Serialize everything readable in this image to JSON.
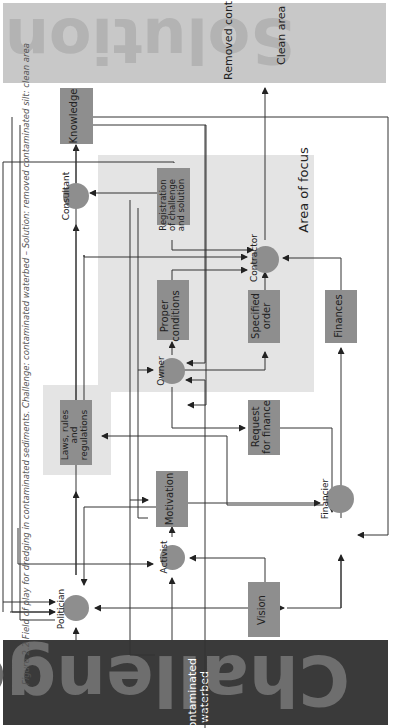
{
  "solution": {
    "title": "Solution",
    "items": [
      "Removed contaminated silt",
      "Clean area"
    ],
    "color": "#c8c8c8",
    "text_color": "#b3b3b3"
  },
  "challenge": {
    "title": "Challenge",
    "items": [
      "Contaminated waterbed"
    ],
    "color": "#3a3a3a",
    "text_color": "#6e6e6e"
  },
  "area_of_focus": {
    "label": "Area of focus",
    "color": "#e4e4e4"
  },
  "nodes": {
    "knowledge": "Knowledge",
    "consultant": "Consultant",
    "registration": "Registration of challenge and solution",
    "contractor": "Contractor",
    "proper_conditions": "Proper conditions",
    "specified_order": "Specified order",
    "finances": "Finances",
    "owner": "Owner",
    "laws": "Laws, rules and regulations",
    "request_finance": "Request for finance",
    "motivation": "Motivation",
    "financier": "Financier",
    "activist": "Activist",
    "politician": "Politician",
    "vision": "Vision"
  },
  "caption": "Figure 2.2 Field of play for dredging in contaminated sediments. Challenge: contaminated waterbed – Solution: removed contaminated silt: clean area",
  "colors": {
    "node": "#8e8e8e",
    "line": "#333333"
  }
}
